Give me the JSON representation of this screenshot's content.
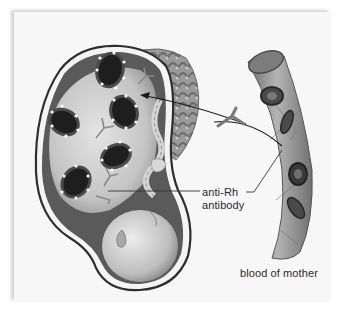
{
  "figure": {
    "labels": {
      "antibody_line1": "anti-Rh",
      "antibody_line2": "antibody",
      "mother_blood": "blood of mother"
    },
    "colors": {
      "panel_bg": "#f7f7f7",
      "uterus_wall": "#3a3a3a",
      "fetus_skin": "#c9c9c9",
      "placenta": "#8a8a8a",
      "vessel": "#9a9a9a",
      "rbc_dark": "#1e1e1e",
      "text": "#2a2a2a"
    },
    "elements": {
      "fetal_rbc_count": 5,
      "maternal_rbc_count": 4
    }
  }
}
